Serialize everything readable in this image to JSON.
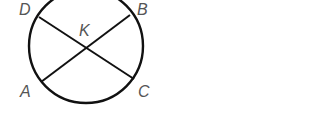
{
  "diagram": {
    "type": "geometry",
    "circle": {
      "cx": 86,
      "cy": 46,
      "r": 57
    },
    "stroke_color": "#111111",
    "label_color": "#555555",
    "points": {
      "D": {
        "label": "D",
        "x": 39,
        "y": 17
      },
      "B": {
        "label": "B",
        "x": 130,
        "y": 15
      },
      "A": {
        "label": "A",
        "x": 41,
        "y": 82
      },
      "C": {
        "label": "C",
        "x": 134,
        "y": 79
      },
      "K": {
        "label": "K",
        "x": 86,
        "y": 48
      }
    },
    "segments": [
      {
        "name": "DC",
        "from": "D",
        "to": "C"
      },
      {
        "name": "AB",
        "from": "A",
        "to": "B"
      }
    ]
  }
}
